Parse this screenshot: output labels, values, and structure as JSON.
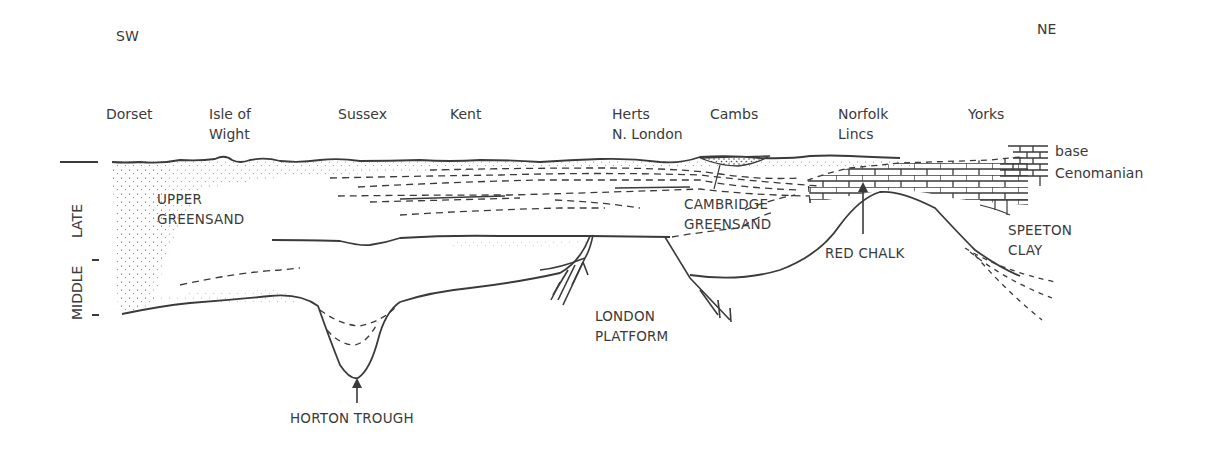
{
  "directions": {
    "left": "SW",
    "right": "NE"
  },
  "regions": [
    {
      "id": "dorset",
      "lines": [
        "Dorset"
      ]
    },
    {
      "id": "isle-of-wight",
      "lines": [
        "Isle of",
        "Wight"
      ]
    },
    {
      "id": "sussex",
      "lines": [
        "Sussex"
      ]
    },
    {
      "id": "kent",
      "lines": [
        "Kent"
      ]
    },
    {
      "id": "herts",
      "lines": [
        "Herts",
        "N. London"
      ]
    },
    {
      "id": "cambs",
      "lines": [
        "Cambs"
      ]
    },
    {
      "id": "norfolk",
      "lines": [
        "Norfolk",
        "Lincs"
      ]
    },
    {
      "id": "yorks",
      "lines": [
        "Yorks"
      ]
    }
  ],
  "time_axis": {
    "late": "LATE",
    "middle": "MIDDLE"
  },
  "units": {
    "upper_greensand": [
      "UPPER",
      "GREENSAND"
    ],
    "cambridge_greensand": [
      "CAMBRIDGE",
      "GREENSAND"
    ],
    "red_chalk": "RED CHALK",
    "speeton_clay": [
      "SPEETON",
      "CLAY"
    ],
    "base_cenomanian": [
      "base",
      "Cenomanian"
    ]
  },
  "structures": {
    "horton_trough": "HORTON TROUGH",
    "london_platform": [
      "LONDON",
      "PLATFORM"
    ]
  },
  "colors": {
    "ink": "#3a3a3a",
    "background": "#ffffff"
  }
}
